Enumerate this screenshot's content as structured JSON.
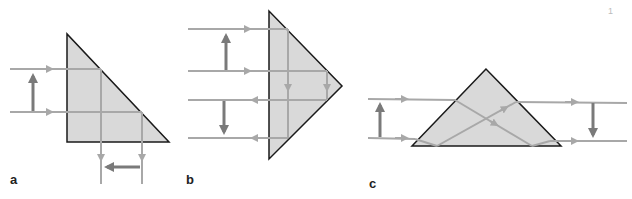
{
  "figure": {
    "panels": [
      {
        "id": "a",
        "label": "a",
        "description": "Right-angle prism, single internal reflection (90° deflection, image flipped)"
      },
      {
        "id": "b",
        "label": "b",
        "description": "Right-angle prism used as retro-reflector (Porro), two internal reflections"
      },
      {
        "id": "c",
        "label": "c",
        "description": "Dove prism, refraction + total internal reflection, image inverted"
      }
    ],
    "page_mark": "1"
  },
  "colors": {
    "prism_fill": "#d9d9d9",
    "prism_edge": "#1a1a1a",
    "ray": "#a8a8a8",
    "image_arrow": "#7a7a7a",
    "background": "#ffffff"
  }
}
